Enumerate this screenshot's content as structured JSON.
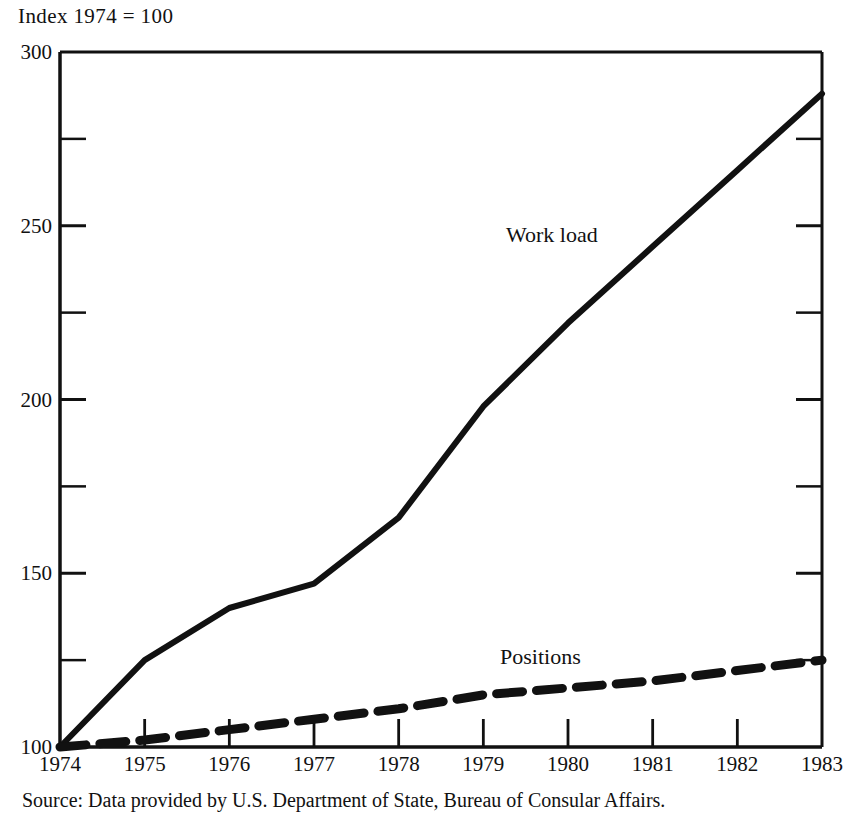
{
  "figure": {
    "axis_title": "Index 1974 = 100",
    "source_note": "Source: Data provided by U.S. Department of State, Bureau of Consular Affairs.",
    "ink_color": "#111111",
    "background_color": "#ffffff"
  },
  "chart_data": {
    "type": "line",
    "title": "Index 1974 = 100",
    "xlabel": "",
    "ylabel": "Index 1974 = 100",
    "xlim": [
      1974,
      1983
    ],
    "ylim": [
      100,
      300
    ],
    "grid": false,
    "legend": "inline-labels",
    "x": [
      1974,
      1975,
      1976,
      1977,
      1978,
      1979,
      1980,
      1981,
      1982,
      1983
    ],
    "xticklabels": [
      "1974",
      "1975",
      "1976",
      "1977",
      "1978",
      "1979",
      "1980",
      "1981",
      "1982",
      "1983"
    ],
    "yticks": [
      100,
      150,
      200,
      250,
      300
    ],
    "yticklabels": [
      "100",
      "150",
      "200",
      "250",
      "300"
    ],
    "yminorticks": [
      125,
      175,
      225,
      275
    ],
    "series": [
      {
        "name": "Work load",
        "style": "solid",
        "values": [
          100,
          125,
          140,
          147,
          166,
          198,
          222,
          244,
          266,
          288
        ]
      },
      {
        "name": "Positions",
        "style": "dashed",
        "values": [
          100,
          102,
          105,
          108,
          111,
          115,
          117,
          119,
          122,
          125
        ]
      }
    ],
    "annotations": [
      {
        "text": "Work load",
        "x": 1979.3,
        "y": 248
      },
      {
        "text": "Positions",
        "x": 1979.2,
        "y": 133
      }
    ]
  }
}
